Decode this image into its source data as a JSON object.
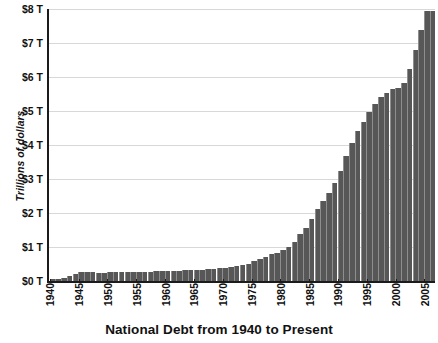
{
  "chart_data": {
    "type": "bar",
    "title": "National Debt from 1940 to Present",
    "xlabel": "",
    "ylabel": "Trillions of dollars",
    "ylim": [
      0,
      8
    ],
    "xlim": [
      1940,
      2006
    ],
    "grid": "horizontal",
    "legend": "none",
    "bar_color": "#575757",
    "gridline_color": "#d8d8d8",
    "axis_color": "#1b1b1b",
    "y_tick_labels": [
      "$0 T",
      "$1 T",
      "$2 T",
      "$3 T",
      "$4 T",
      "$5 T",
      "$6 T",
      "$7 T",
      "$8 T"
    ],
    "y_tick_values": [
      0,
      1,
      2,
      3,
      4,
      5,
      6,
      7,
      8
    ],
    "x_tick_labels": [
      "1940",
      "1945",
      "1950",
      "1955",
      "1960",
      "1965",
      "1970",
      "1975",
      "1980",
      "1985",
      "1990",
      "1995",
      "2000",
      "2005"
    ],
    "x_tick_values": [
      1940,
      1945,
      1950,
      1955,
      1960,
      1965,
      1970,
      1975,
      1980,
      1985,
      1990,
      1995,
      2000,
      2005
    ],
    "categories": [
      1940,
      1941,
      1942,
      1943,
      1944,
      1945,
      1946,
      1947,
      1948,
      1949,
      1950,
      1951,
      1952,
      1953,
      1954,
      1955,
      1956,
      1957,
      1958,
      1959,
      1960,
      1961,
      1962,
      1963,
      1964,
      1965,
      1966,
      1967,
      1968,
      1969,
      1970,
      1971,
      1972,
      1973,
      1974,
      1975,
      1976,
      1977,
      1978,
      1979,
      1980,
      1981,
      1982,
      1983,
      1984,
      1985,
      1986,
      1987,
      1988,
      1989,
      1990,
      1991,
      1992,
      1993,
      1994,
      1995,
      1996,
      1997,
      1998,
      1999,
      2000,
      2001,
      2002,
      2003,
      2004,
      2005,
      2006
    ],
    "values": [
      0.05,
      0.06,
      0.08,
      0.14,
      0.2,
      0.26,
      0.27,
      0.26,
      0.25,
      0.25,
      0.26,
      0.26,
      0.26,
      0.27,
      0.27,
      0.27,
      0.27,
      0.27,
      0.28,
      0.29,
      0.29,
      0.29,
      0.3,
      0.31,
      0.32,
      0.32,
      0.33,
      0.34,
      0.36,
      0.37,
      0.38,
      0.41,
      0.44,
      0.47,
      0.49,
      0.58,
      0.65,
      0.72,
      0.78,
      0.83,
      0.91,
      1.0,
      1.14,
      1.38,
      1.57,
      1.82,
      2.12,
      2.35,
      2.6,
      2.87,
      3.23,
      3.67,
      4.06,
      4.41,
      4.69,
      4.97,
      5.22,
      5.41,
      5.53,
      5.66,
      5.67,
      5.81,
      6.23,
      6.78,
      7.38,
      7.93,
      7.93
    ]
  },
  "chart": {
    "title": "National Debt from 1940 to Present",
    "y_axis_title": "Trillions of dollars"
  }
}
